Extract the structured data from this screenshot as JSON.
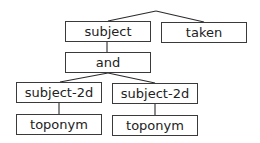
{
  "diagram": {
    "type": "tree",
    "nodes": [
      {
        "id": "subject",
        "label": "subject",
        "x": 65,
        "y": 21,
        "w": 86,
        "h": 21
      },
      {
        "id": "taken",
        "label": "taken",
        "x": 161,
        "y": 22,
        "w": 86,
        "h": 21
      },
      {
        "id": "and",
        "label": "and",
        "x": 65,
        "y": 52,
        "w": 86,
        "h": 21
      },
      {
        "id": "subject-2d-left",
        "label": "subject-2d",
        "x": 16,
        "y": 82,
        "w": 86,
        "h": 21
      },
      {
        "id": "subject-2d-right",
        "label": "subject-2d",
        "x": 112,
        "y": 83,
        "w": 86,
        "h": 21
      },
      {
        "id": "toponym-left",
        "label": "toponym",
        "x": 16,
        "y": 114,
        "w": 86,
        "h": 21
      },
      {
        "id": "toponym-right",
        "label": "toponym",
        "x": 112,
        "y": 115,
        "w": 86,
        "h": 21
      }
    ],
    "edges": [
      {
        "from": "root",
        "to": "subject"
      },
      {
        "from": "root",
        "to": "taken"
      },
      {
        "from": "subject",
        "to": "and"
      },
      {
        "from": "and",
        "to": "subject-2d-left"
      },
      {
        "from": "and",
        "to": "subject-2d-right"
      },
      {
        "from": "subject-2d-left",
        "to": "toponym-left"
      },
      {
        "from": "subject-2d-right",
        "to": "toponym-right"
      }
    ]
  }
}
